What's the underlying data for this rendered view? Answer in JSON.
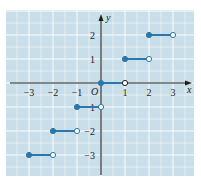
{
  "chart_data": {
    "type": "line",
    "title": "",
    "subtitle": "",
    "xlabel": "x",
    "ylabel": "y",
    "origin_label": "O",
    "xlim": [
      -3.5,
      3.5
    ],
    "ylim": [
      -3.5,
      3.5
    ],
    "grid": true,
    "legend": null,
    "x_ticks": [
      -3,
      -2,
      -1,
      1,
      2,
      3
    ],
    "y_ticks": [
      -3,
      -2,
      -1,
      1,
      2
    ],
    "x_tick_labels": [
      "−3",
      "−2",
      "−1",
      "1",
      "2",
      "3"
    ],
    "y_tick_labels": [
      "−3",
      "−2",
      "−1",
      "1",
      "2"
    ],
    "series": [
      {
        "name": "step function (floor)",
        "style": "step segments, closed dot at left endpoint, open dot at right endpoint",
        "segments": [
          {
            "x_start": -3,
            "x_end": -2,
            "y": -3,
            "start_closed": true,
            "end_closed": false
          },
          {
            "x_start": -2,
            "x_end": -1,
            "y": -2,
            "start_closed": true,
            "end_closed": false
          },
          {
            "x_start": -1,
            "x_end": 0,
            "y": -1,
            "start_closed": true,
            "end_closed": false
          },
          {
            "x_start": 0,
            "x_end": 1,
            "y": 0,
            "start_closed": true,
            "end_closed": false
          },
          {
            "x_start": 1,
            "x_end": 2,
            "y": 1,
            "start_closed": true,
            "end_closed": false
          },
          {
            "x_start": 2,
            "x_end": 3,
            "y": 2,
            "start_closed": true,
            "end_closed": false
          }
        ]
      }
    ]
  },
  "colors": {
    "panel_background": "#c8dfea",
    "grid_line": "#ffffff",
    "axis": "#1e1e1e",
    "curve": "#2a78ad",
    "open_dot_fill": "#ffffff"
  }
}
